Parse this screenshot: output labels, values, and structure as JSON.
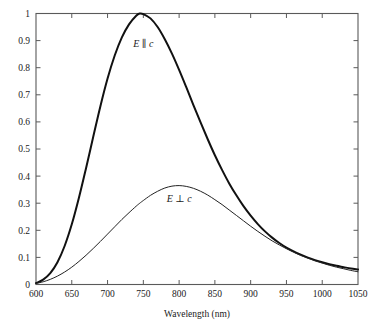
{
  "chart_data": {
    "type": "line",
    "title": "",
    "subtitle": "",
    "xlabel": "Wavelength (nm)",
    "ylabel": "",
    "xlim": [
      600,
      1050
    ],
    "ylim": [
      0,
      1
    ],
    "xticks": [
      600,
      650,
      700,
      750,
      800,
      850,
      900,
      950,
      1000,
      1050
    ],
    "yticks": [
      0,
      0.1,
      0.2,
      0.3,
      0.4,
      0.5,
      0.6,
      0.7,
      0.8,
      0.9,
      1
    ],
    "xtick_labels": [
      "600",
      "650",
      "700",
      "750",
      "800",
      "850",
      "900",
      "950",
      "1000",
      "1050"
    ],
    "ytick_labels": [
      "0",
      "0.1",
      "0.2",
      "0.3",
      "0.4",
      "0.5",
      "0.6",
      "0.7",
      "0.8",
      "0.9",
      "1"
    ],
    "grid": false,
    "legend": "inline-annotations",
    "x": [
      600,
      610,
      620,
      630,
      640,
      650,
      660,
      670,
      680,
      690,
      700,
      710,
      720,
      730,
      740,
      745,
      750,
      760,
      770,
      780,
      790,
      800,
      810,
      820,
      830,
      840,
      850,
      860,
      870,
      880,
      890,
      900,
      910,
      920,
      930,
      940,
      950,
      960,
      970,
      980,
      990,
      1000,
      1010,
      1020,
      1030,
      1040,
      1050
    ],
    "series": [
      {
        "name": "E ∥ c",
        "label_parts": {
          "field": "E",
          "relation": "∥",
          "axis": "c"
        },
        "line_width": "thick",
        "color": "#111111",
        "peak_x": 745,
        "peak_y": 1.0,
        "values": [
          0.005,
          0.018,
          0.042,
          0.082,
          0.142,
          0.222,
          0.32,
          0.43,
          0.545,
          0.658,
          0.76,
          0.845,
          0.912,
          0.96,
          0.992,
          1.0,
          0.998,
          0.982,
          0.95,
          0.905,
          0.852,
          0.792,
          0.728,
          0.662,
          0.598,
          0.536,
          0.477,
          0.423,
          0.373,
          0.329,
          0.289,
          0.254,
          0.223,
          0.196,
          0.173,
          0.153,
          0.136,
          0.122,
          0.11,
          0.099,
          0.09,
          0.082,
          0.075,
          0.069,
          0.064,
          0.059,
          0.055
        ]
      },
      {
        "name": "E ⊥ c",
        "label_parts": {
          "field": "E",
          "relation": "⊥",
          "axis": "c"
        },
        "line_width": "thin",
        "color": "#222222",
        "peak_x": 775,
        "peak_y": 0.365,
        "values": [
          0.004,
          0.01,
          0.019,
          0.031,
          0.046,
          0.064,
          0.085,
          0.108,
          0.133,
          0.159,
          0.186,
          0.213,
          0.24,
          0.265,
          0.289,
          0.3,
          0.31,
          0.329,
          0.344,
          0.356,
          0.363,
          0.365,
          0.362,
          0.355,
          0.344,
          0.33,
          0.313,
          0.295,
          0.275,
          0.255,
          0.235,
          0.215,
          0.196,
          0.178,
          0.161,
          0.146,
          0.132,
          0.119,
          0.107,
          0.097,
          0.087,
          0.079,
          0.071,
          0.064,
          0.058,
          0.052,
          0.047
        ]
      }
    ],
    "annotations": [
      {
        "text": "E ∥ c",
        "x": 750,
        "y": 0.875,
        "id": "label-e-parallel-c"
      },
      {
        "text": "E ⊥ c",
        "x": 800,
        "y": 0.305,
        "id": "label-e-perp-c"
      }
    ]
  },
  "axes": {
    "x_axis_title": "Wavelength (nm)",
    "y_axis_title": ""
  },
  "labels": {
    "e_parallel_field": "E",
    "e_parallel_symbol": "∥",
    "e_parallel_axis": "c",
    "e_perp_field": "E",
    "e_perp_symbol": "⊥",
    "e_perp_axis": "c"
  },
  "colors": {
    "frame": "#5a5a5a",
    "curve_thick": "#111111",
    "curve_thin": "#222222",
    "background": "#ffffff",
    "text": "#1a1a1a"
  }
}
